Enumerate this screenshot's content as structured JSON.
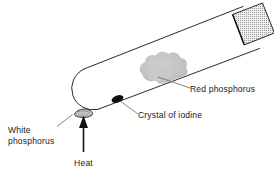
{
  "figure": {
    "background_color": "#ffffff",
    "line_color": "#1a1a1a",
    "apparatus": {
      "name": "inclined sealed test tube",
      "tube_fill": "#ffffff",
      "tube_outline": "#2b2b2b"
    }
  },
  "labels": {
    "red_phosphorus": "Red phosphorus",
    "crystal_of_iodine": "Crystal of iodine",
    "white_phosphorus_line1": "White",
    "white_phosphorus_line2": "phosphorus",
    "heat": "Heat"
  },
  "substances": [
    {
      "key": "red_phosphorus",
      "label": "Red phosphorus",
      "appearance": "irregular granular deposit",
      "color": "#bdbdbd"
    },
    {
      "key": "crystal_of_iodine",
      "label": "Crystal of iodine",
      "appearance": "small solid crystal",
      "color": "#111111"
    },
    {
      "key": "white_phosphorus",
      "label": "White phosphorus",
      "appearance": "small molten pool at sealed end",
      "color": "#c8c8c8"
    }
  ],
  "stopper": {
    "name": "stopper",
    "pattern": "stippled",
    "fill": "#e3e3e3",
    "dot_color": "#8a8a8a",
    "outline": "#2b2b2b"
  },
  "heat_source": {
    "label": "Heat",
    "direction": "upward",
    "arrow_color": "#111111"
  }
}
